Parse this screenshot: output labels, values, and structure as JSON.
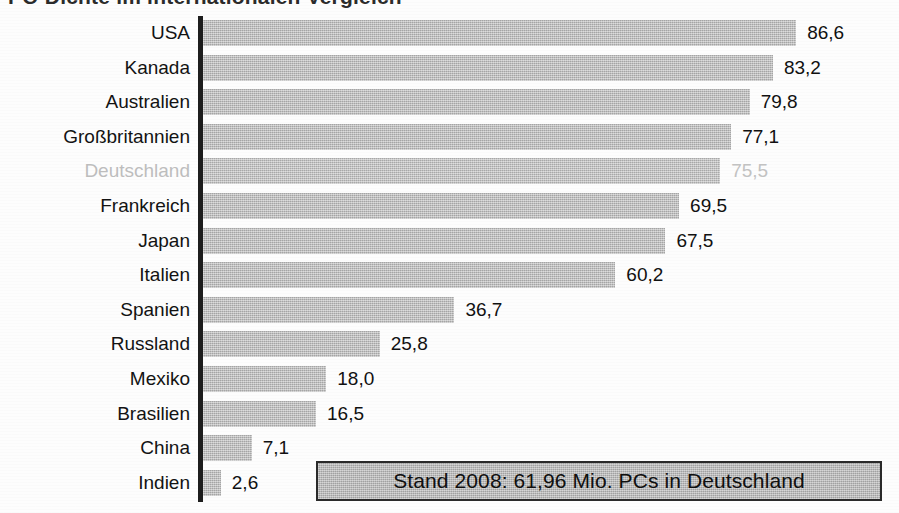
{
  "chart_data": {
    "type": "bar",
    "orientation": "horizontal",
    "title": "PC-Dichte im internationalen Vergleich",
    "xlabel": "",
    "ylabel": "",
    "categories": [
      "USA",
      "Kanada",
      "Australien",
      "Großbritannien",
      "Deutschland",
      "Frankreich",
      "Japan",
      "Italien",
      "Spanien",
      "Russland",
      "Mexiko",
      "Brasilien",
      "China",
      "Indien"
    ],
    "values": [
      86.6,
      83.2,
      79.8,
      77.1,
      75.5,
      69.5,
      67.5,
      60.2,
      36.7,
      25.8,
      18.0,
      16.5,
      7.1,
      2.6
    ],
    "value_labels": [
      "86,6",
      "83,2",
      "79,8",
      "77,1",
      "75,5",
      "69,5",
      "67,5",
      "60,2",
      "36,7",
      "25,8",
      "18,0",
      "16,5",
      "7,1",
      "2,6"
    ],
    "highlight_index": 4,
    "xlim": [
      0,
      100
    ],
    "grid": false,
    "legend": false,
    "annotation": "Stand 2008: 61,96 Mio. PCs in Deutschland",
    "colors": {
      "bar": "#b8b8b8",
      "bar_highlight": "#bcbcbc",
      "label": "#131313",
      "label_highlight": "#bdbdbd",
      "axis": "#1d1d1d",
      "annotation_fill": "#b4b4b4",
      "annotation_border": "#2a2a2a",
      "background": "#fdfdfd"
    }
  },
  "footnote": {
    "text": "Stand 2008: 61,96 Mio. PCs in Deutschland"
  }
}
